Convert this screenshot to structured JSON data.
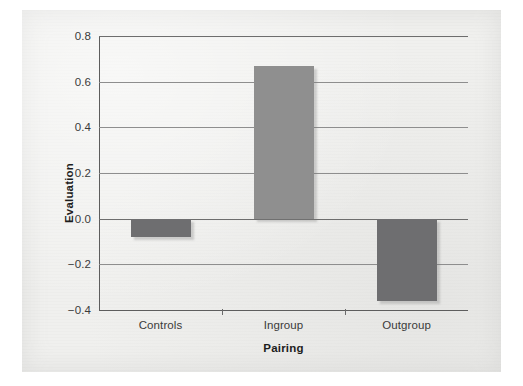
{
  "chart_data": {
    "type": "bar",
    "title": "",
    "subtitle": "",
    "xlabel": "Pairing",
    "ylabel": "Evaluation",
    "categories": [
      "Controls",
      "Ingroup",
      "Outgroup"
    ],
    "values": [
      -0.08,
      0.67,
      -0.36
    ],
    "series": [
      {
        "name": "Evaluation",
        "values": [
          -0.08,
          0.67,
          -0.36
        ]
      }
    ],
    "ylim": [
      -0.4,
      0.8
    ],
    "yticks": [
      -0.4,
      -0.2,
      0.0,
      0.2,
      0.4,
      0.6,
      0.8
    ],
    "ytick_labels": [
      "−0.4",
      "−0.2",
      "0.0",
      "0.2",
      "0.4",
      "0.6",
      "0.8"
    ],
    "grid": true,
    "grid_axis": "y",
    "legend": false,
    "legend_position": "none",
    "bar_colors": [
      "#6e6e70",
      "#8f8f8f",
      "#6e6e70"
    ],
    "annotations": []
  },
  "figure": {
    "page_background": "#f0f0ee",
    "outer_background": "#ffffff",
    "axis_color": "#5d5d5d",
    "gridline_color": "#8e8e8e",
    "tick_text_color": "#3a3a3a",
    "axis_title_color": "#1d1d1d"
  }
}
